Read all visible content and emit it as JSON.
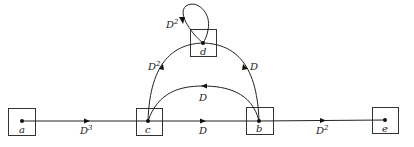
{
  "diagram": {
    "type": "directed-graph",
    "nodes": [
      {
        "id": "a",
        "label": "a"
      },
      {
        "id": "c",
        "label": "c"
      },
      {
        "id": "b",
        "label": "b"
      },
      {
        "id": "e",
        "label": "e"
      },
      {
        "id": "d",
        "label": "d"
      }
    ],
    "edges": [
      {
        "from": "a",
        "to": "c",
        "label_base": "D",
        "label_exp": "3"
      },
      {
        "from": "c",
        "to": "b",
        "label_base": "D",
        "label_exp": ""
      },
      {
        "from": "b",
        "to": "e",
        "label_base": "D",
        "label_exp": "2"
      },
      {
        "from": "b",
        "to": "c",
        "label_base": "D",
        "label_exp": ""
      },
      {
        "from": "c",
        "to": "d",
        "label_base": "D",
        "label_exp": "2"
      },
      {
        "from": "d",
        "to": "b",
        "label_base": "D",
        "label_exp": ""
      },
      {
        "from": "d",
        "to": "d",
        "label_base": "D",
        "label_exp": "2"
      }
    ]
  }
}
